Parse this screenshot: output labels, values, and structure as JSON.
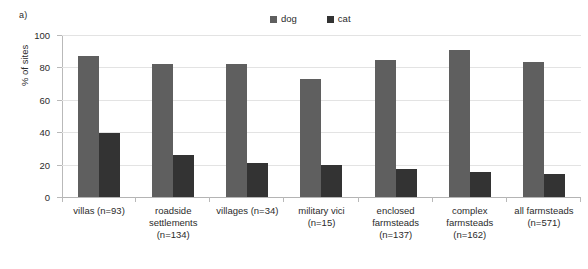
{
  "panel": {
    "label": "a)"
  },
  "legend": {
    "position": "top-center",
    "entries": [
      {
        "label": "dog",
        "color": "#5f5f5f"
      },
      {
        "label": "cat",
        "color": "#333333"
      }
    ]
  },
  "axes": {
    "ylabel": "% of sites",
    "yticks": [
      "0",
      "20",
      "40",
      "60",
      "80",
      "100"
    ]
  },
  "chart_data": {
    "type": "bar",
    "title": "",
    "subtitle": "",
    "xlabel": "",
    "ylabel": "% of sites",
    "ylim": [
      0,
      100
    ],
    "ytick_values": [
      0,
      20,
      40,
      60,
      80,
      100
    ],
    "grid": true,
    "legend_position": "top-center",
    "annotations": [
      "a)"
    ],
    "categories": [
      "villas (n=93)",
      "roadside settlements (n=134)",
      "villages (n=34)",
      "military vici (n=15)",
      "enclosed farmsteads (n=137)",
      "complex farmsteads (n=162)",
      "all farmsteads (n=571)"
    ],
    "category_lines": [
      [
        "villas (n=93)"
      ],
      [
        "roadside",
        "settlements",
        "(n=134)"
      ],
      [
        "villages (n=34)"
      ],
      [
        "military vici",
        "(n=15)"
      ],
      [
        "enclosed",
        "farmsteads",
        "(n=137)"
      ],
      [
        "complex",
        "farmsteads",
        "(n=162)"
      ],
      [
        "all farmsteads",
        "(n=571)"
      ]
    ],
    "series": [
      {
        "name": "dog",
        "color": "#5f5f5f",
        "values": [
          87,
          82,
          82,
          73,
          84.5,
          90.5,
          83.5
        ]
      },
      {
        "name": "cat",
        "color": "#333333",
        "values": [
          39.5,
          26,
          21,
          20,
          17,
          15.5,
          14.5
        ]
      }
    ]
  }
}
